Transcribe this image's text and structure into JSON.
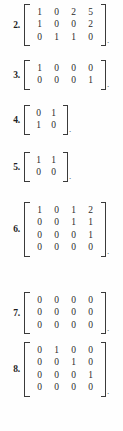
{
  "page": {
    "background_color": "#fefefe",
    "ink_color": "#2e2e2e",
    "bracket_color": "#3a3a3a"
  },
  "items": [
    {
      "number": "2.",
      "rows": 3,
      "cols": 4,
      "matrix": [
        [
          "1",
          "0",
          "2",
          "5"
        ],
        [
          "1",
          "0",
          "0",
          "2"
        ],
        [
          "0",
          "1",
          "1",
          "0"
        ]
      ],
      "trailing": "."
    },
    {
      "number": "3.",
      "rows": 2,
      "cols": 4,
      "matrix": [
        [
          "1",
          "0",
          "0",
          "0"
        ],
        [
          "0",
          "0",
          "0",
          "1"
        ]
      ],
      "trailing": "."
    },
    {
      "number": "4.",
      "rows": 2,
      "cols": 2,
      "matrix": [
        [
          "0",
          "1"
        ],
        [
          "1",
          "0"
        ]
      ],
      "trailing": "."
    },
    {
      "number": "5.",
      "rows": 2,
      "cols": 2,
      "matrix": [
        [
          "1",
          "1"
        ],
        [
          "0",
          "0"
        ]
      ],
      "trailing": "."
    },
    {
      "number": "6.",
      "rows": 4,
      "cols": 4,
      "matrix": [
        [
          "1",
          "0",
          "1",
          "2"
        ],
        [
          "0",
          "0",
          "1",
          "1"
        ],
        [
          "0",
          "0",
          "0",
          "1"
        ],
        [
          "0",
          "0",
          "0",
          "0"
        ]
      ],
      "trailing": "."
    },
    {
      "number": "7.",
      "rows": 3,
      "cols": 4,
      "matrix": [
        [
          "0",
          "0",
          "0",
          "0"
        ],
        [
          "0",
          "0",
          "0",
          "0"
        ],
        [
          "0",
          "0",
          "0",
          "0"
        ]
      ],
      "trailing": "."
    },
    {
      "number": "8.",
      "rows": 4,
      "cols": 4,
      "matrix": [
        [
          "0",
          "1",
          "0",
          "0"
        ],
        [
          "0",
          "0",
          "1",
          "0"
        ],
        [
          "0",
          "0",
          "0",
          "1"
        ],
        [
          "0",
          "0",
          "0",
          "0"
        ]
      ],
      "trailing": "."
    }
  ],
  "bottom_sliver_text": ""
}
